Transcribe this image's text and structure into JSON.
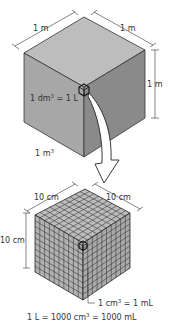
{
  "diagram": {
    "large_cube": {
      "edge_label_left": "1 m",
      "edge_label_right": "1 m",
      "edge_label_height": "1 m",
      "volume_label": "1 m",
      "volume_label_exp": "3",
      "small_cube_label_prefix": "1 dm",
      "small_cube_label_exp": "3",
      "small_cube_label_suffix": " = 1 L",
      "colors": {
        "top": "#bdbdbd",
        "left": "#a7a7a7",
        "right": "#8a8a8a"
      }
    },
    "arrow": {
      "direction": "down",
      "meaning": "zoom into 1 dm3 cube"
    },
    "small_cube": {
      "edge_label_left": "10 cm",
      "edge_label_right": "10 cm",
      "edge_label_height": "10 cm",
      "grid_divisions": 10,
      "unit_cube_label_prefix": "1 cm",
      "unit_cube_label_exp": "3",
      "unit_cube_label_suffix": " = 1 mL",
      "colors": {
        "face": "#b5b5b5",
        "grid": "#3a3a3a"
      }
    },
    "equation": {
      "part1": "1 L = 1000 cm",
      "exp": "3",
      "part2": " = 1000 mL"
    }
  }
}
